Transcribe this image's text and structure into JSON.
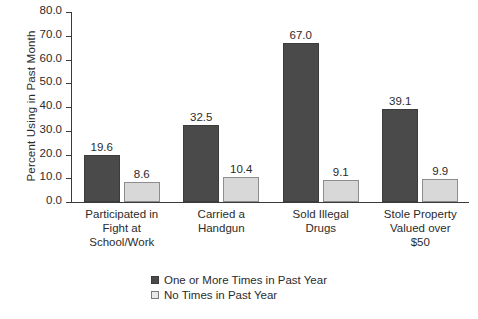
{
  "chart_data": {
    "type": "bar",
    "title": "",
    "subtitle": "",
    "xlabel": "",
    "ylabel": "Percent Using in Past Month",
    "ylim": [
      0.0,
      80.0
    ],
    "ytick_step": 10.0,
    "yticks": [
      "80.0",
      "70.0",
      "60.0",
      "50.0",
      "40.0",
      "30.0",
      "20.0",
      "10.0",
      "0.0"
    ],
    "grid": false,
    "legend_position": "bottom-center",
    "categories": [
      "Participated in\nFight at\nSchool/Work",
      "Carried a\nHandgun",
      "Sold Illegal\nDrugs",
      "Stole Property\nValued over\n$50"
    ],
    "category_lines": [
      [
        "Participated in",
        "Fight at",
        "School/Work"
      ],
      [
        "Carried a",
        "Handgun"
      ],
      [
        "Sold Illegal",
        "Drugs"
      ],
      [
        "Stole Property",
        "Valued over",
        "$50"
      ]
    ],
    "series": [
      {
        "name": "One or More Times in Past Year",
        "color": "#4a4a4a",
        "values": [
          19.6,
          32.5,
          67.0,
          39.1
        ],
        "labels": [
          "19.6",
          "32.5",
          "67.0",
          "39.1"
        ]
      },
      {
        "name": "No Times in Past Year",
        "color": "#d8d8d8",
        "values": [
          8.6,
          10.4,
          9.1,
          9.9
        ],
        "labels": [
          "8.6",
          "10.4",
          "9.1",
          "9.9"
        ]
      }
    ]
  },
  "colors": {
    "series_one_or_more": "#4a4a4a",
    "series_no_times": "#d8d8d8",
    "axis": "#3a3a3a",
    "text": "#2b2b2b",
    "background": "#ffffff"
  },
  "legend": {
    "items": [
      {
        "label": "One or More Times in Past Year"
      },
      {
        "label": "No Times in Past Year"
      }
    ]
  }
}
